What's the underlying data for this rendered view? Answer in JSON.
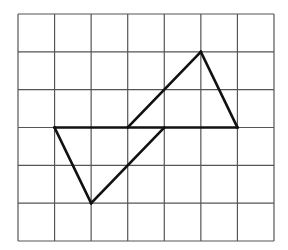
{
  "diagram": {
    "type": "grid-figure",
    "grid": {
      "columns": 7,
      "rows": 6,
      "origin_px": [
        18,
        14
      ],
      "cell_width_px": 36.57,
      "cell_height_px": 37.83,
      "line_color": "#555555"
    },
    "figure": {
      "line_color": "#111111",
      "segments": [
        {
          "name": "base-line",
          "from": [
            1,
            3
          ],
          "to": [
            6,
            3
          ]
        },
        {
          "name": "upper-triangle-left-edge",
          "from": [
            3,
            3
          ],
          "to": [
            5,
            1
          ]
        },
        {
          "name": "upper-triangle-right-edge",
          "from": [
            5,
            1
          ],
          "to": [
            6,
            3
          ]
        },
        {
          "name": "lower-triangle-left-edge",
          "from": [
            1,
            3
          ],
          "to": [
            2,
            5
          ]
        },
        {
          "name": "lower-triangle-right-edge",
          "from": [
            2,
            5
          ],
          "to": [
            4,
            3
          ]
        }
      ],
      "shapes": [
        {
          "name": "upper-triangle",
          "vertices": [
            [
              3,
              3
            ],
            [
              5,
              1
            ],
            [
              6,
              3
            ]
          ]
        },
        {
          "name": "lower-triangle",
          "vertices": [
            [
              1,
              3
            ],
            [
              2,
              5
            ],
            [
              4,
              3
            ]
          ]
        }
      ]
    }
  }
}
